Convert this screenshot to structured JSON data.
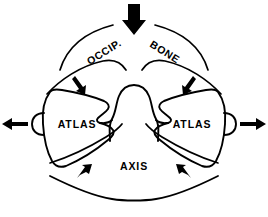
{
  "figure": {
    "background_color": "#ffffff",
    "line_color": "#000000",
    "width": 268,
    "height": 217
  },
  "labels": {
    "occipital": "OCCIP.",
    "bone": "BONE",
    "atlas_left": "ATLAS",
    "atlas_right": "ATLAS",
    "axis": "AXIS"
  },
  "arrows": {
    "axial_load": {
      "name": "axial-compression-arrow",
      "direction": "down",
      "style": "thick"
    },
    "lateral_left": {
      "name": "left-lateral-displacement-arrow",
      "direction": "left",
      "style": "medium"
    },
    "lateral_right": {
      "name": "right-lateral-displacement-arrow",
      "direction": "right",
      "style": "medium"
    },
    "occipito_atlantal_left": {
      "name": "left-occipitoatlantal-force-arrow",
      "direction": "down-right",
      "style": "small"
    },
    "occipito_atlantal_right": {
      "name": "right-occipitoatlantal-force-arrow",
      "direction": "down-left",
      "style": "small"
    },
    "atlanto_axial_left": {
      "name": "left-atlantoaxial-force-arrow",
      "direction": "up-right",
      "style": "small"
    },
    "atlanto_axial_right": {
      "name": "right-atlantoaxial-force-arrow",
      "direction": "up-left",
      "style": "small"
    }
  }
}
